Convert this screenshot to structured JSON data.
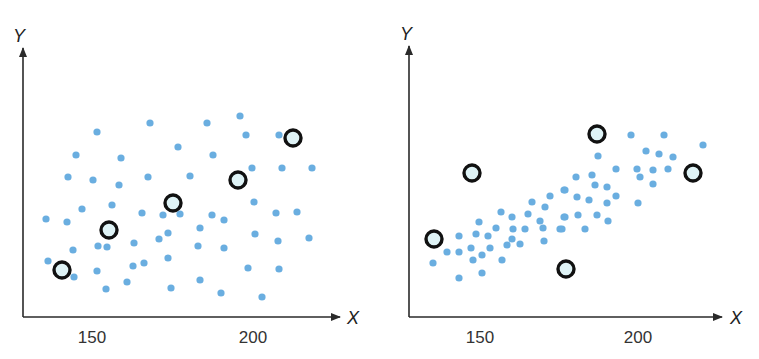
{
  "colors": {
    "dot": "#6aaee0",
    "outlier_fill": "#dff3f6",
    "outlier_stroke": "#111111",
    "axis": "#2a2a2a"
  },
  "chart_data": [
    {
      "type": "scatter",
      "title": "",
      "xlabel": "X",
      "ylabel": "Y",
      "xticks": [
        150,
        200
      ],
      "xlim": [
        132,
        220
      ],
      "grid": false,
      "frame": {
        "x0": 23,
        "x1": 340,
        "y_top": 48,
        "y_axis": 317,
        "px150": 92,
        "px200": 253
      },
      "series": [
        {
          "name": "points",
          "points": [
            [
              97,
              132
            ],
            [
              150,
              123
            ],
            [
              207,
              123
            ],
            [
              240,
              116
            ],
            [
              246,
              135
            ],
            [
              279,
              135
            ],
            [
              76,
              155
            ],
            [
              121,
              158
            ],
            [
              178,
              147
            ],
            [
              213,
              155
            ],
            [
              252,
              168
            ],
            [
              282,
              168
            ],
            [
              312,
              168
            ],
            [
              68,
              177
            ],
            [
              93,
              180
            ],
            [
              148,
              177
            ],
            [
              190,
              176
            ],
            [
              46,
              219
            ],
            [
              67,
              222
            ],
            [
              82,
              209
            ],
            [
              112,
              205
            ],
            [
              119,
              185
            ],
            [
              142,
              213
            ],
            [
              163,
              215
            ],
            [
              180,
              214
            ],
            [
              212,
              215
            ],
            [
              224,
              220
            ],
            [
              200,
              228
            ],
            [
              254,
              202
            ],
            [
              276,
              213
            ],
            [
              297,
              212
            ],
            [
              309,
              238
            ],
            [
              255,
              234
            ],
            [
              278,
              241
            ],
            [
              73,
              250
            ],
            [
              98,
              246
            ],
            [
              107,
              247
            ],
            [
              134,
              243
            ],
            [
              159,
              239
            ],
            [
              168,
              233
            ],
            [
              198,
              246
            ],
            [
              224,
              248
            ],
            [
              48,
              261
            ],
            [
              74,
              277
            ],
            [
              97,
              271
            ],
            [
              133,
              266
            ],
            [
              144,
              263
            ],
            [
              168,
              258
            ],
            [
              248,
              268
            ],
            [
              279,
              269
            ],
            [
              106,
              289
            ],
            [
              127,
              282
            ],
            [
              171,
              288
            ],
            [
              200,
              280
            ],
            [
              221,
              293
            ],
            [
              262,
              297
            ]
          ]
        },
        {
          "name": "highlighted",
          "points": [
            [
              62,
              270
            ],
            [
              109,
              230
            ],
            [
              173,
              203
            ],
            [
              238,
              180
            ],
            [
              293,
              138
            ]
          ]
        }
      ]
    },
    {
      "type": "scatter",
      "title": "",
      "xlabel": "X",
      "ylabel": "Y",
      "xticks": [
        150,
        200
      ],
      "xlim": [
        132,
        224
      ],
      "grid": false,
      "frame": {
        "x0": 409,
        "x1": 722,
        "y_top": 46,
        "y_axis": 317,
        "px150": 480,
        "px200": 638
      },
      "series": [
        {
          "name": "points",
          "points": [
            [
              433,
              263
            ],
            [
              447,
              252
            ],
            [
              459,
              252
            ],
            [
              459,
              236
            ],
            [
              459,
              278
            ],
            [
              471,
              248
            ],
            [
              473,
              260
            ],
            [
              482,
              255
            ],
            [
              482,
              273
            ],
            [
              476,
              234
            ],
            [
              479,
              222
            ],
            [
              488,
              236
            ],
            [
              490,
              248
            ],
            [
              496,
              228
            ],
            [
              501,
              212
            ],
            [
              502,
              260
            ],
            [
              507,
              245
            ],
            [
              512,
              217
            ],
            [
              513,
              229
            ],
            [
              512,
              239
            ],
            [
              520,
              244
            ],
            [
              525,
              229
            ],
            [
              528,
              214
            ],
            [
              532,
              202
            ],
            [
              540,
              221
            ],
            [
              543,
              228
            ],
            [
              544,
              241
            ],
            [
              545,
              207
            ],
            [
              550,
              196
            ],
            [
              560,
              229
            ],
            [
              564,
              217
            ],
            [
              564,
              190
            ],
            [
              631,
              135
            ],
            [
              664,
              135
            ],
            [
              703,
              145
            ],
            [
              646,
              151
            ],
            [
              659,
              154
            ],
            [
              673,
              157
            ],
            [
              598,
              156
            ],
            [
              616,
              169
            ],
            [
              637,
              169
            ],
            [
              653,
              170
            ],
            [
              668,
              169
            ],
            [
              640,
              177
            ],
            [
              653,
              184
            ],
            [
              576,
              177
            ],
            [
              592,
              175
            ],
            [
              595,
              185
            ],
            [
              607,
              187
            ],
            [
              616,
              196
            ],
            [
              577,
              197
            ],
            [
              589,
              200
            ],
            [
              607,
              203
            ],
            [
              638,
              203
            ],
            [
              565,
              190
            ],
            [
              565,
              217
            ],
            [
              578,
              215
            ],
            [
              597,
              215
            ],
            [
              608,
              221
            ],
            [
              562,
              229
            ],
            [
              585,
              229
            ]
          ]
        },
        {
          "name": "highlighted",
          "points": [
            [
              434,
              239
            ],
            [
              472,
              173
            ],
            [
              597,
              134
            ],
            [
              693,
              173
            ],
            [
              566,
              269
            ]
          ]
        }
      ]
    }
  ],
  "left": {
    "ylabel": "Y",
    "xlabel": "X",
    "tick_150": "150",
    "tick_200": "200"
  },
  "right": {
    "ylabel": "Y",
    "xlabel": "X",
    "tick_150": "150",
    "tick_200": "200"
  }
}
